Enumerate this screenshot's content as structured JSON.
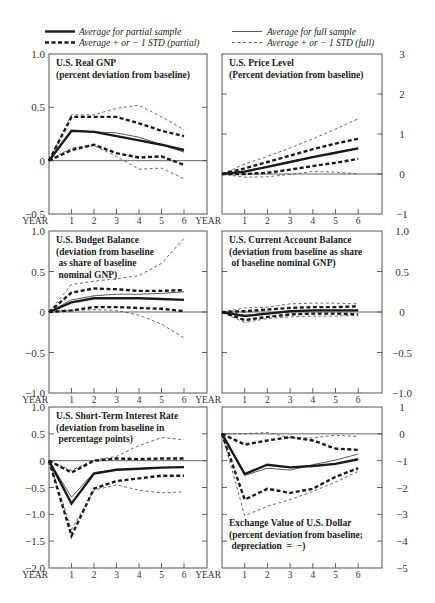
{
  "legend": {
    "avg_partial": "Average for partial sample",
    "std_partial": "Average + or − 1 STD (partial)",
    "avg_full": "Average for full sample",
    "std_full": "Average + or − 1 STD (full)"
  },
  "x_axis": {
    "label": "YEAR",
    "ticks": [
      "1",
      "2",
      "3",
      "4",
      "5",
      "6"
    ]
  },
  "chart_data": [
    {
      "type": "line",
      "title": "U.S. Real GNP",
      "subtitle": "(percent deviation from baseline)",
      "title_lines": [
        "U.S. Real GNP",
        "(percent deviation from baseline)"
      ],
      "xlabel": "YEAR",
      "x": [
        0,
        1,
        2,
        3,
        4,
        5,
        6
      ],
      "ylim": [
        -0.5,
        1.0
      ],
      "yticks": [
        "1.0",
        "0.5",
        "0",
        "−0.5"
      ],
      "ytick_values": [
        1.0,
        0.5,
        0,
        -0.5
      ],
      "ytick_side": "left",
      "series": [
        {
          "name": "Average for partial sample",
          "style": "avg-partial",
          "values": [
            0,
            0.28,
            0.27,
            0.23,
            0.19,
            0.15,
            0.1
          ]
        },
        {
          "name": "Average for full sample",
          "style": "avg-full",
          "values": [
            0,
            0.28,
            0.27,
            0.26,
            0.22,
            0.15,
            0.08
          ]
        },
        {
          "name": "Average + 1 STD (partial)",
          "style": "std-partial",
          "values": [
            0,
            0.41,
            0.41,
            0.41,
            0.35,
            0.28,
            0.23
          ]
        },
        {
          "name": "Average - 1 STD (partial)",
          "style": "std-partial",
          "values": [
            0,
            0.1,
            0.15,
            0.07,
            0.03,
            0.04,
            -0.04
          ]
        },
        {
          "name": "Average + 1 STD (full)",
          "style": "std-full",
          "values": [
            0,
            0.43,
            0.43,
            0.49,
            0.52,
            0.41,
            0.29
          ]
        },
        {
          "name": "Average - 1 STD (full)",
          "style": "std-full",
          "values": [
            0,
            0.12,
            0.14,
            0.04,
            -0.08,
            -0.07,
            -0.17
          ]
        }
      ]
    },
    {
      "type": "line",
      "title": "U.S. Price Level",
      "subtitle": "(Percent deviation from baseline)",
      "title_lines": [
        "U.S. Price Level",
        "(Percent deviation from baseline)"
      ],
      "xlabel": "YEAR",
      "x": [
        0,
        1,
        2,
        3,
        4,
        5,
        6
      ],
      "ylim": [
        -1,
        3
      ],
      "yticks": [
        "3",
        "2",
        "1",
        "0",
        "−1"
      ],
      "ytick_values": [
        3,
        2,
        1,
        0,
        -1
      ],
      "ytick_side": "right",
      "series": [
        {
          "name": "Average for partial sample",
          "style": "avg-partial",
          "values": [
            0,
            0.06,
            0.18,
            0.3,
            0.42,
            0.53,
            0.64
          ]
        },
        {
          "name": "Average for full sample",
          "style": "avg-full",
          "values": [
            0,
            0.07,
            0.19,
            0.31,
            0.43,
            0.54,
            0.65
          ]
        },
        {
          "name": "Average + 1 STD (partial)",
          "style": "std-partial",
          "values": [
            0,
            0.14,
            0.3,
            0.46,
            0.62,
            0.76,
            0.88
          ]
        },
        {
          "name": "Average - 1 STD (partial)",
          "style": "std-partial",
          "values": [
            0,
            0.0,
            0.03,
            0.11,
            0.2,
            0.28,
            0.38
          ]
        },
        {
          "name": "Average + 1 STD (full)",
          "style": "std-full",
          "values": [
            0,
            0.25,
            0.44,
            0.65,
            0.88,
            1.12,
            1.38
          ]
        },
        {
          "name": "Average - 1 STD (full)",
          "style": "std-full",
          "values": [
            0,
            -0.08,
            -0.07,
            -0.01,
            0.06,
            0.05,
            0.0
          ]
        }
      ]
    },
    {
      "type": "line",
      "title": "U.S. Budget Balance",
      "subtitle": "(deviation from baseline as share of baseline nominal GNP)",
      "title_lines": [
        "U.S. Budget Balance",
        "(deviation from baseline",
        " as share of baseline",
        " nominal GNP)"
      ],
      "xlabel": "YEAR",
      "x": [
        0,
        1,
        2,
        3,
        4,
        5,
        6
      ],
      "ylim": [
        -1.0,
        1.0
      ],
      "yticks": [
        "1.0",
        "0.5",
        "0",
        "−0.5",
        "−1.0"
      ],
      "ytick_values": [
        1.0,
        0.5,
        0,
        -0.5,
        -1.0
      ],
      "ytick_side": "left",
      "series": [
        {
          "name": "Average for partial sample",
          "style": "avg-partial",
          "values": [
            0,
            0.12,
            0.17,
            0.17,
            0.17,
            0.16,
            0.15
          ]
        },
        {
          "name": "Average for full sample",
          "style": "avg-full",
          "values": [
            0,
            0.15,
            0.2,
            0.22,
            0.22,
            0.23,
            0.25
          ]
        },
        {
          "name": "Average + 1 STD (partial)",
          "style": "std-partial",
          "values": [
            0,
            0.24,
            0.29,
            0.28,
            0.26,
            0.26,
            0.27
          ]
        },
        {
          "name": "Average - 1 STD (partial)",
          "style": "std-partial",
          "values": [
            0,
            0.02,
            0.06,
            0.06,
            0.05,
            0.04,
            0.01
          ]
        },
        {
          "name": "Average + 1 STD (full)",
          "style": "std-full",
          "values": [
            0,
            0.34,
            0.38,
            0.41,
            0.45,
            0.6,
            0.91
          ]
        },
        {
          "name": "Average - 1 STD (full)",
          "style": "std-full",
          "values": [
            0,
            0.02,
            0.03,
            0.02,
            -0.04,
            -0.15,
            -0.32
          ]
        }
      ]
    },
    {
      "type": "line",
      "title": "U.S. Current Account Balance",
      "subtitle": "(deviation from baseline as share of baseline nominal GNP)",
      "title_lines": [
        "U.S. Current Account Balance",
        "(deviation from baseline as share",
        " of baseline nominal GNP)"
      ],
      "xlabel": "YEAR",
      "x": [
        0,
        1,
        2,
        3,
        4,
        5,
        6
      ],
      "ylim": [
        -1.0,
        1.0
      ],
      "yticks": [
        "1.0",
        "0.5",
        "0",
        "−0.5",
        "−1.0"
      ],
      "ytick_values": [
        1.0,
        0.5,
        0,
        -0.5,
        -1.0
      ],
      "ytick_side": "right",
      "series": [
        {
          "name": "Average for partial sample",
          "style": "avg-partial",
          "values": [
            0,
            -0.05,
            -0.02,
            0.01,
            0.02,
            0.02,
            0.02
          ]
        },
        {
          "name": "Average for full sample",
          "style": "avg-full",
          "values": [
            0,
            -0.04,
            -0.02,
            0.01,
            0.02,
            0.02,
            0.02
          ]
        },
        {
          "name": "Average + 1 STD (partial)",
          "style": "std-partial",
          "values": [
            0,
            0.01,
            0.03,
            0.05,
            0.06,
            0.06,
            0.07
          ]
        },
        {
          "name": "Average - 1 STD (partial)",
          "style": "std-partial",
          "values": [
            0,
            -0.1,
            -0.06,
            -0.03,
            -0.02,
            -0.02,
            -0.03
          ]
        },
        {
          "name": "Average + 1 STD (full)",
          "style": "std-full",
          "values": [
            0,
            0.05,
            0.06,
            0.1,
            0.11,
            0.11,
            0.1
          ]
        },
        {
          "name": "Average - 1 STD (full)",
          "style": "std-full",
          "values": [
            0,
            -0.13,
            -0.08,
            -0.06,
            -0.05,
            -0.05,
            -0.04
          ]
        }
      ]
    },
    {
      "type": "line",
      "title": "U.S. Short-Term Interest Rate",
      "subtitle": "(deviation from baseline in percentage points)",
      "title_lines": [
        "U.S. Short-Term Interest Rate",
        "(deviation from baseline in",
        " percentage points)"
      ],
      "xlabel": "YEAR",
      "x": [
        0,
        1,
        2,
        3,
        4,
        5,
        6
      ],
      "ylim": [
        -2.0,
        1.0
      ],
      "yticks": [
        "1.0",
        "0.5",
        "0",
        "−0.5",
        "−1.0",
        "−1.5",
        "−2.0"
      ],
      "ytick_values": [
        1.0,
        0.5,
        0,
        -0.5,
        -1.0,
        -1.5,
        -2.0
      ],
      "ytick_side": "left",
      "series": [
        {
          "name": "Average for partial sample",
          "style": "avg-partial",
          "values": [
            0,
            -0.8,
            -0.24,
            -0.17,
            -0.15,
            -0.13,
            -0.12
          ]
        },
        {
          "name": "Average for full sample",
          "style": "avg-full",
          "values": [
            0,
            -0.68,
            -0.22,
            -0.17,
            -0.15,
            -0.13,
            -0.12
          ]
        },
        {
          "name": "Average + 1 STD (partial)",
          "style": "std-partial",
          "values": [
            0,
            -0.22,
            0.0,
            0.04,
            0.03,
            0.04,
            0.04
          ]
        },
        {
          "name": "Average - 1 STD (partial)",
          "style": "std-partial",
          "values": [
            0,
            -1.4,
            -0.52,
            -0.38,
            -0.33,
            -0.28,
            -0.28
          ]
        },
        {
          "name": "Average + 1 STD (full)",
          "style": "std-full",
          "values": [
            0,
            -0.18,
            0.01,
            0.08,
            0.28,
            0.43,
            0.39
          ]
        },
        {
          "name": "Average - 1 STD (full)",
          "style": "std-full",
          "values": [
            0,
            -1.28,
            -0.55,
            -0.45,
            -0.55,
            -0.6,
            -0.58
          ]
        }
      ]
    },
    {
      "type": "line",
      "title": "Exchange Value of U.S. Dollar",
      "subtitle": "(percent deviation from baseline; depreciation = −)",
      "title_lines": [
        "Exchange Value of U.S. Dollar",
        "(percent deviation from baseline;",
        " depreciation  =  −)"
      ],
      "xlabel": "YEAR",
      "x": [
        0,
        1,
        2,
        3,
        4,
        5,
        6
      ],
      "ylim": [
        -5,
        1
      ],
      "yticks": [
        "1",
        "0",
        "−1",
        "−2",
        "−3",
        "−4",
        "−5"
      ],
      "ytick_values": [
        1,
        0,
        -1,
        -2,
        -3,
        -4,
        -5
      ],
      "ytick_side": "right",
      "series": [
        {
          "name": "Average for partial sample",
          "style": "avg-partial",
          "values": [
            0,
            -1.5,
            -1.15,
            -1.25,
            -1.2,
            -1.12,
            -0.95
          ]
        },
        {
          "name": "Average for full sample",
          "style": "avg-full",
          "values": [
            0,
            -1.55,
            -1.28,
            -1.35,
            -1.15,
            -0.98,
            -0.75
          ]
        },
        {
          "name": "Average + 1 STD (partial)",
          "style": "std-partial",
          "values": [
            0,
            -0.4,
            -0.25,
            -0.12,
            -0.25,
            -0.55,
            -0.6
          ]
        },
        {
          "name": "Average - 1 STD (partial)",
          "style": "std-partial",
          "values": [
            0,
            -2.45,
            -2.05,
            -2.2,
            -2.05,
            -1.6,
            -1.28
          ]
        },
        {
          "name": "Average + 1 STD (full)",
          "style": "std-full",
          "values": [
            0,
            0.0,
            0.05,
            -0.15,
            -0.15,
            -0.05,
            -0.1
          ]
        },
        {
          "name": "Average - 1 STD (full)",
          "style": "std-full",
          "values": [
            0,
            -3.05,
            -2.7,
            -2.45,
            -2.15,
            -1.8,
            -1.4
          ]
        }
      ]
    }
  ]
}
